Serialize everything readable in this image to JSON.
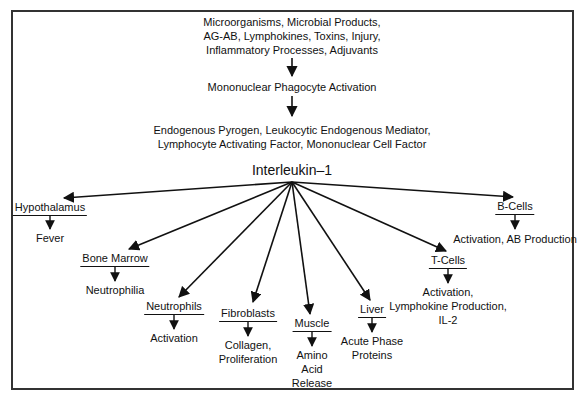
{
  "diagram": {
    "top_sources": "Microorganisms, Microbial Products,\nAG-AB, Lymphokines, Toxins, Injury,\nInflammatory Processes, Adjuvants",
    "top_sources_lines": [
      "Microorganisms, Microbial Products,",
      "AG-AB, Lymphokines, Toxins, Injury,",
      "Inflammatory Processes, Adjuvants"
    ],
    "step2": "Mononuclear Phagocyte Activation",
    "step3_lines": [
      "Endogenous Pyrogen, Leukocytic Endogenous Mediator,",
      "Lymphocyte Activating Factor, Mononuclear Cell Factor"
    ],
    "hub": "Interleukin–1",
    "targets": [
      {
        "name": "Hypothalamus",
        "effect_lines": [
          "Fever"
        ]
      },
      {
        "name": "Bone Marrow",
        "effect_lines": [
          "Neutrophilia"
        ]
      },
      {
        "name": "Neutrophils",
        "effect_lines": [
          "Activation"
        ]
      },
      {
        "name": "Fibroblasts",
        "effect_lines": [
          "Collagen,",
          "Proliferation"
        ]
      },
      {
        "name": "Muscle",
        "effect_lines": [
          "Amino",
          "Acid",
          "Release"
        ]
      },
      {
        "name": "Liver",
        "effect_lines": [
          "Acute Phase",
          "Proteins"
        ]
      },
      {
        "name": "T-Cells",
        "effect_lines": [
          "Activation,",
          "Lymphokine Production,",
          "IL-2"
        ]
      },
      {
        "name": "B-Cells",
        "effect_lines": [
          "Activation, AB Production"
        ]
      }
    ]
  }
}
